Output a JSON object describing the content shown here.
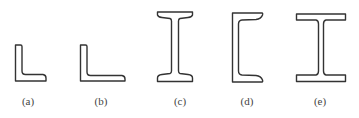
{
  "figure": {
    "panels": [
      {
        "id": "a",
        "label": "(a)",
        "shape": "equal-leg-angle",
        "label_x": 28
      },
      {
        "id": "b",
        "label": "(b)",
        "shape": "unequal-leg-angle",
        "label_x": 101
      },
      {
        "id": "c",
        "label": "(c)",
        "shape": "tapered-flange-i-beam",
        "label_x": 180
      },
      {
        "id": "d",
        "label": "(d)",
        "shape": "channel-section",
        "label_x": 247
      },
      {
        "id": "e",
        "label": "(e)",
        "shape": "wide-flange-h-beam",
        "label_x": 320
      }
    ],
    "colors": {
      "stroke": "#333333",
      "background": "#ffffff"
    }
  }
}
